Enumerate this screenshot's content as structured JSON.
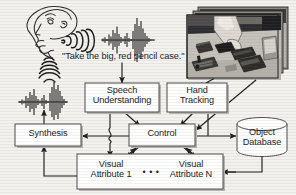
{
  "figure": {
    "type": "system-architecture-diagram",
    "caption_text": "\"Take the big, red pencil case.\""
  },
  "nodes": {
    "speech_understanding": {
      "line1": "Speech",
      "line2": "Understanding"
    },
    "hand_tracking": {
      "line1": "Hand",
      "line2": "Tracking"
    },
    "synthesis": {
      "label": "Synthesis"
    },
    "control": {
      "label": "Control"
    },
    "object_database": {
      "line1": "Object",
      "line2": "Database"
    },
    "visual_attribute_1": {
      "line1": "Visual",
      "line2": "Attribute 1"
    },
    "visual_attribute_n": {
      "line1": "Visual",
      "line2": "Attribute N"
    },
    "ellipsis": {
      "label": "• • •"
    }
  },
  "media": {
    "head_icon": "speaking-head-profile",
    "sound_waves_mouth": "sound-wave-arcs",
    "sound_waves_output": "sound-wave-arcs-down",
    "waveform_input": "audio-waveform",
    "waveform_output": "audio-waveform",
    "photo_stack": "hand-over-table-objects-photo-sequence",
    "photo_count": 3
  },
  "colors": {
    "background": "#f3f2ef",
    "ink": "#1b1b1b",
    "box_fill": "#ffffff",
    "box_stroke": "#4a4a4a",
    "box_shadow": "#b9b7b2"
  }
}
